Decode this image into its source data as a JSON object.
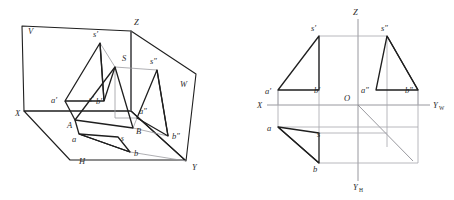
{
  "page": {
    "width": 454,
    "height": 200,
    "background": "#ffffff",
    "stroke_dark": "#1f1f1f",
    "stroke_mid": "#4a4a4a",
    "stroke_light": "#9a9aa0",
    "label_color": "#2b2b2b",
    "clipped_header_text": "· · ·   · · · · · · · · · · · · · · · · ·"
  },
  "figures": [
    {
      "id": "pictorial",
      "name": "three-plane-pictorial-projection",
      "description": "Pictorial view of point-triangle SAB projected onto V, H and W planes",
      "labels": [
        {
          "key": "V",
          "text": "V",
          "x": 28,
          "y": 34,
          "italic": true
        },
        {
          "key": "Z",
          "text": "Z",
          "x": 134,
          "y": 25,
          "italic": true
        },
        {
          "key": "W",
          "text": "W",
          "x": 180,
          "y": 87,
          "italic": true
        },
        {
          "key": "X",
          "text": "X",
          "x": 15,
          "y": 116,
          "italic": true
        },
        {
          "key": "Y",
          "text": "Y",
          "x": 192,
          "y": 170,
          "italic": true
        },
        {
          "key": "H",
          "text": "H",
          "x": 79,
          "y": 164,
          "italic": true
        },
        {
          "key": "S",
          "text": "S",
          "x": 122,
          "y": 61,
          "italic": true
        },
        {
          "key": "A",
          "text": "A",
          "x": 67,
          "y": 128,
          "italic": true
        },
        {
          "key": "B",
          "text": "B",
          "x": 136,
          "y": 134,
          "italic": true
        },
        {
          "key": "sp",
          "text": "s′",
          "x": 93,
          "y": 37,
          "italic": true
        },
        {
          "key": "spp",
          "text": "s″",
          "x": 150,
          "y": 64,
          "italic": true
        },
        {
          "key": "ap",
          "text": "a′",
          "x": 51,
          "y": 103,
          "italic": true
        },
        {
          "key": "bp",
          "text": "b′",
          "x": 96,
          "y": 104,
          "italic": true
        },
        {
          "key": "spmini",
          "text": "s′",
          "x": 89,
          "y": 102,
          "italic": true,
          "small": true
        },
        {
          "key": "app",
          "text": "a″",
          "x": 139,
          "y": 114,
          "italic": true
        },
        {
          "key": "bpp",
          "text": "b″",
          "x": 172,
          "y": 139,
          "italic": true
        },
        {
          "key": "a",
          "text": "a",
          "x": 72,
          "y": 142,
          "italic": true
        },
        {
          "key": "b",
          "text": "b",
          "x": 134,
          "y": 156,
          "italic": true
        },
        {
          "key": "s",
          "text": "s",
          "x": 121,
          "y": 141,
          "italic": true
        }
      ],
      "points": {
        "Zcorner": [
          131,
          31
        ],
        "Vtopleft": [
          22,
          26
        ],
        "Xcorner": [
          24,
          111
        ],
        "Hleft": [
          24,
          111
        ],
        "Hbottom": [
          70,
          160
        ],
        "Hright": [
          185,
          160
        ],
        "Ycorner": [
          186,
          161
        ],
        "Wright": [
          196,
          74
        ],
        "sp": [
          100,
          43
        ],
        "ap": [
          65,
          101
        ],
        "bp": [
          104,
          101
        ],
        "S": [
          115,
          67
        ],
        "spp": [
          157,
          70
        ],
        "app": [
          137,
          118
        ],
        "bpp": [
          168,
          136
        ],
        "A": [
          75,
          120
        ],
        "B": [
          133,
          128
        ],
        "a": [
          79,
          134
        ],
        "b": [
          130,
          152
        ],
        "s": [
          118,
          137
        ]
      }
    },
    {
      "id": "orthographic",
      "name": "three-view-orthographic-projection",
      "description": "Standard three-view layout with X, Y-W, Y-H and Z axes and origin O",
      "labels": [
        {
          "key": "Z",
          "text": "Z",
          "x": 126,
          "y": 15,
          "italic": true
        },
        {
          "key": "X",
          "text": "X",
          "x": 34,
          "y": 95,
          "italic": true
        },
        {
          "key": "O",
          "text": "O",
          "x": 119,
          "y": 95,
          "italic": true
        },
        {
          "key": "YW",
          "text": "Y",
          "x": 207,
          "y": 95,
          "italic": true,
          "sub": "W"
        },
        {
          "key": "YH",
          "text": "Y",
          "x": 127,
          "y": 188,
          "italic": true,
          "sub": "H"
        },
        {
          "key": "sp",
          "text": "s′",
          "x": 86,
          "y": 30,
          "italic": true
        },
        {
          "key": "spp",
          "text": "s″",
          "x": 156,
          "y": 30,
          "italic": true
        },
        {
          "key": "ap",
          "text": "a′",
          "x": 41,
          "y": 95,
          "italic": true
        },
        {
          "key": "bp",
          "text": "b′",
          "x": 90,
          "y": 94,
          "italic": true
        },
        {
          "key": "app",
          "text": "a″",
          "x": 136,
          "y": 94,
          "italic": true
        },
        {
          "key": "bpp",
          "text": "b″",
          "x": 180,
          "y": 94,
          "italic": true
        },
        {
          "key": "a",
          "text": "a",
          "x": 42,
          "y": 131,
          "italic": true
        },
        {
          "key": "s",
          "text": "s",
          "x": 92,
          "y": 136,
          "italic": true
        },
        {
          "key": "b",
          "text": "b",
          "x": 88,
          "y": 169,
          "italic": true
        }
      ],
      "axes": {
        "X_left": [
          40,
          105
        ],
        "YW_right": [
          203,
          105
        ],
        "Z_top": [
          131,
          19
        ],
        "YH_bottom": [
          131,
          181
        ],
        "O": [
          131,
          105
        ],
        "diagonal_end": [
          186,
          161
        ]
      },
      "points": {
        "sp": [
          92,
          36
        ],
        "ap": [
          51,
          90
        ],
        "bp": [
          92,
          90
        ],
        "spp": [
          160,
          36
        ],
        "app": [
          160,
          90
        ],
        "bpp": [
          191,
          90
        ],
        "a": [
          51,
          127
        ],
        "s": [
          92,
          133
        ],
        "b": [
          92,
          163
        ],
        "b_right": [
          191,
          163
        ]
      }
    }
  ]
}
